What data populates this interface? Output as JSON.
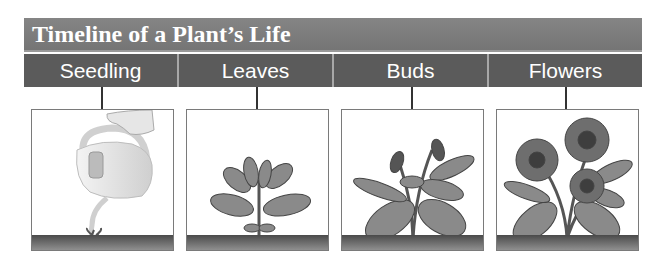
{
  "title": "Timeline of a Plant’s Life",
  "stages": [
    {
      "label": "Seedling",
      "illustration": "watering-can-seedling"
    },
    {
      "label": "Leaves",
      "illustration": "leafy-plant"
    },
    {
      "label": "Buds",
      "illustration": "budding-plant"
    },
    {
      "label": "Flowers",
      "illustration": "flowering-pansy"
    }
  ],
  "colors": {
    "title_bar": "#7b7b7b",
    "label_bar": "#5b5b5b",
    "text": "#ffffff",
    "soil": "#5a5a5a"
  }
}
